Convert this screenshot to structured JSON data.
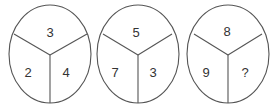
{
  "puzzle": {
    "circles": [
      {
        "top": "3",
        "left": "2",
        "right": "4"
      },
      {
        "top": "5",
        "left": "7",
        "right": "3"
      },
      {
        "top": "8",
        "left": "9",
        "right": "?"
      }
    ]
  },
  "colors": {
    "stroke": "#555555",
    "text": "#333333",
    "background": "#ffffff"
  }
}
